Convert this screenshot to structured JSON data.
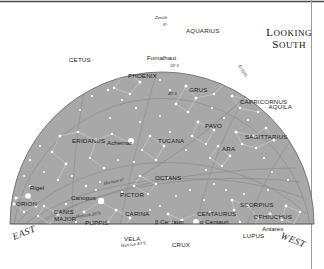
{
  "chart_data": {
    "type": "scatter",
    "title": "Looking South",
    "subtitle": "",
    "projection": "half-dome sky map, southern horizon view",
    "xlabel": "",
    "ylabel": "",
    "grid": true,
    "legend_position": "none",
    "background_color": "#a8a8a8",
    "star_color": "#ffffff",
    "line_color": "#d2d2d2",
    "grid_color": "#7a7a7a",
    "text_color": "#1d1d1d",
    "compass": {
      "left": "EAST",
      "right": "WEST"
    },
    "zenith": {
      "label": "Zenith",
      "value": "0°"
    },
    "altitude_circles": [
      {
        "label": "20°S",
        "x": 170,
        "y": 67
      },
      {
        "label": "40°S",
        "x": 168,
        "y": 95
      }
    ],
    "horizon_labels": [
      {
        "label": "Horizon 0°",
        "x": 104,
        "y": 185
      },
      {
        "label": "Horizon 20°S",
        "x": 76,
        "y": 218
      },
      {
        "label": "Horizon 40°S",
        "x": 121,
        "y": 247
      }
    ],
    "ecliptic_label": "Ecliptic",
    "constellations": [
      {
        "name": "AQUARIUS",
        "x": 186,
        "y": 33
      },
      {
        "name": "CETUS",
        "x": 69,
        "y": 62
      },
      {
        "name": "CAPRICORNUS",
        "x": 240,
        "y": 104
      },
      {
        "name": "PHOENIX",
        "x": 128,
        "y": 78
      },
      {
        "name": "GRUS",
        "x": 189,
        "y": 92
      },
      {
        "name": "AQUILA",
        "x": 292,
        "y": 109
      },
      {
        "name": "ERIDANUS",
        "x": 72,
        "y": 143
      },
      {
        "name": "TUCANA",
        "x": 158,
        "y": 143
      },
      {
        "name": "PAVO",
        "x": 205,
        "y": 128
      },
      {
        "name": "SAGITTARIUS",
        "x": 245,
        "y": 139
      },
      {
        "name": "OCTANS",
        "x": 155,
        "y": 180
      },
      {
        "name": "ARA",
        "x": 222,
        "y": 151
      },
      {
        "name": "PICTOR",
        "x": 120,
        "y": 197
      },
      {
        "name": "SCORPIUS",
        "x": 240,
        "y": 207
      },
      {
        "name": "CANIS",
        "x": 54,
        "y": 214
      },
      {
        "name": "MAJOR",
        "x": 54,
        "y": 221
      },
      {
        "name": "CARINA",
        "x": 125,
        "y": 216
      },
      {
        "name": "CENTAURUS",
        "x": 197,
        "y": 216
      },
      {
        "name": "OPHIUCHUS",
        "x": 292,
        "y": 219
      },
      {
        "name": "PUPPIS",
        "x": 85,
        "y": 225
      },
      {
        "name": "ORION",
        "x": 16,
        "y": 206
      },
      {
        "name": "VELA",
        "x": 124,
        "y": 241
      },
      {
        "name": "CRUX",
        "x": 172,
        "y": 247
      },
      {
        "name": "LUPUS",
        "x": 243,
        "y": 238
      }
    ],
    "named_stars": [
      {
        "name": "Fomalhaut",
        "x": 147,
        "y": 60,
        "dot_x": 181,
        "dot_y": 63,
        "mag": 1.2
      },
      {
        "name": "Achernar",
        "x": 107,
        "y": 145,
        "dot_x": 131,
        "dot_y": 141,
        "mag": 1.3
      },
      {
        "name": "Rigel",
        "x": 30,
        "y": 190,
        "dot_x": 28,
        "dot_y": 196,
        "mag": 1.2
      },
      {
        "name": "Canopus",
        "x": 71,
        "y": 200,
        "dot_x": 101,
        "dot_y": 201,
        "mag": 1.5
      },
      {
        "name": "β Centauri",
        "x": 155,
        "y": 224,
        "dot_x": 171,
        "dot_y": 224,
        "mag": 1.2
      },
      {
        "name": "α Centauri",
        "x": 200,
        "y": 224,
        "dot_x": 196,
        "dot_y": 222,
        "mag": 1.3
      },
      {
        "name": "Antares",
        "x": 262,
        "y": 231,
        "dot_x": 258,
        "dot_y": 227,
        "mag": 1.1
      }
    ]
  },
  "title_block": {
    "line1": "Looking",
    "line2": "South"
  }
}
